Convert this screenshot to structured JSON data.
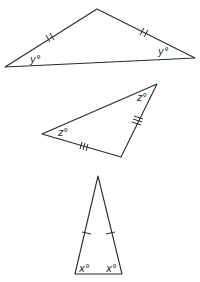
{
  "diagram": {
    "type": "geometry-triangles",
    "triangles": [
      {
        "name": "obtuse-isosceles",
        "vertices": [
          [
            5,
            67
          ],
          [
            97,
            9
          ],
          [
            195,
            58
          ]
        ],
        "equal_sides_mark": "double-tick",
        "angles": [
          {
            "label": "y°",
            "at": "left-base"
          },
          {
            "label": "y°",
            "at": "right-base"
          }
        ]
      },
      {
        "name": "right-ish-isosceles",
        "vertices": [
          [
            42,
            134
          ],
          [
            157,
            84
          ],
          [
            121,
            157
          ]
        ],
        "equal_sides_mark": "triple-tick",
        "angles": [
          {
            "label": "z°",
            "at": "left"
          },
          {
            "label": "z°",
            "at": "top-right"
          }
        ]
      },
      {
        "name": "tall-isosceles",
        "vertices": [
          [
            98,
            176
          ],
          [
            75,
            274
          ],
          [
            122,
            274
          ]
        ],
        "equal_sides_mark": "single-tick",
        "angles": [
          {
            "label": "x°",
            "at": "bottom-left"
          },
          {
            "label": "x°",
            "at": "bottom-right"
          }
        ]
      }
    ],
    "labels": {
      "t1_left": "y°",
      "t1_right": "y°",
      "t2_left": "z°",
      "t2_right": "z°",
      "t3_left": "x°",
      "t3_right": "x°"
    },
    "colors": {
      "stroke": "#2a2a2a",
      "background": "#ffffff"
    }
  }
}
